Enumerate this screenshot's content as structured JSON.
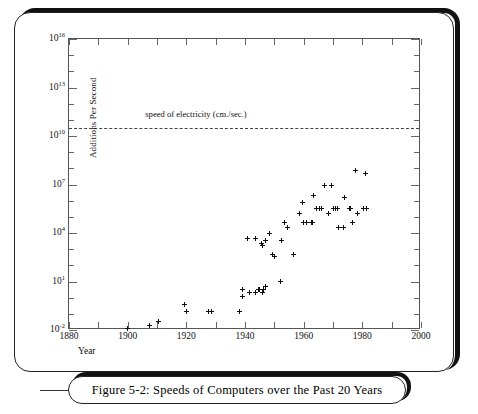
{
  "figure": {
    "caption": "Figure 5-2:   Speeds of Computers over the Past 20 Years"
  },
  "chart_data": {
    "type": "scatter",
    "title": "",
    "xlabel": "Year",
    "ylabel": "Additions Per Second",
    "xlim": [
      1880,
      2000
    ],
    "ylim": [
      0.01,
      1e+16
    ],
    "yscale": "log",
    "xscale": "linear",
    "grid": false,
    "legend": null,
    "xticks": [
      "1880",
      "1900",
      "1920",
      "1940",
      "1960",
      "1980",
      "2000"
    ],
    "xtick_values": [
      1880,
      1900,
      1920,
      1940,
      1960,
      1980,
      2000
    ],
    "yticks": [
      "10^16",
      "10^13",
      "10^10",
      "10^7",
      "10^4",
      "10^1",
      "10^-2"
    ],
    "ytick_exponents": [
      16,
      13,
      10,
      7,
      4,
      1,
      -2
    ],
    "ytick_mantissa": "10",
    "annotations": [
      {
        "name": "speed-of-electricity",
        "text": "speed of electricity (cm./sec.)",
        "kind": "hline-with-label",
        "y_value": 30000000000.0,
        "linestyle": "dashed",
        "label_x_value": 1906,
        "label_y_value": 200000000000.0
      }
    ],
    "marker": "plus",
    "points": [
      {
        "x": 1900.0,
        "y": 0.013
      },
      {
        "x": 1907.5,
        "y": 0.02
      },
      {
        "x": 1910.5,
        "y": 0.033
      },
      {
        "x": 1919.5,
        "y": 0.36
      },
      {
        "x": 1920.0,
        "y": 0.13
      },
      {
        "x": 1927.5,
        "y": 0.13
      },
      {
        "x": 1928.5,
        "y": 0.13
      },
      {
        "x": 1938.0,
        "y": 0.13
      },
      {
        "x": 1939.0,
        "y": 3.3
      },
      {
        "x": 1939.0,
        "y": 1.1
      },
      {
        "x": 1941.5,
        "y": 2.2
      },
      {
        "x": 1943.5,
        "y": 2.0
      },
      {
        "x": 1944.5,
        "y": 3.2
      },
      {
        "x": 1945.0,
        "y": 3.2
      },
      {
        "x": 1945.8,
        "y": 2.0
      },
      {
        "x": 1946.3,
        "y": 3.3
      },
      {
        "x": 1947.0,
        "y": 4.6
      },
      {
        "x": 1952.0,
        "y": 10.0
      },
      {
        "x": 1941.0,
        "y": 4600.0
      },
      {
        "x": 1943.5,
        "y": 4600.0
      },
      {
        "x": 1945.5,
        "y": 2200.0
      },
      {
        "x": 1946.0,
        "y": 1600.0
      },
      {
        "x": 1947.0,
        "y": 3300.0
      },
      {
        "x": 1948.5,
        "y": 10000.0
      },
      {
        "x": 1949.5,
        "y": 460.0
      },
      {
        "x": 1950.0,
        "y": 330.0
      },
      {
        "x": 1952.5,
        "y": 3300.0
      },
      {
        "x": 1956.5,
        "y": 460.0
      },
      {
        "x": 1953.5,
        "y": 46000.0
      },
      {
        "x": 1954.5,
        "y": 22000.0
      },
      {
        "x": 1958.5,
        "y": 150000.0
      },
      {
        "x": 1959.5,
        "y": 800000.0
      },
      {
        "x": 1960.0,
        "y": 46000.0
      },
      {
        "x": 1961.0,
        "y": 46000.0
      },
      {
        "x": 1962.5,
        "y": 46000.0
      },
      {
        "x": 1963.0,
        "y": 46000.0
      },
      {
        "x": 1963.5,
        "y": 2200000.0
      },
      {
        "x": 1964.5,
        "y": 330000.0
      },
      {
        "x": 1965.5,
        "y": 330000.0
      },
      {
        "x": 1966.0,
        "y": 330000.0
      },
      {
        "x": 1967.0,
        "y": 9000000.0
      },
      {
        "x": 1968.5,
        "y": 160000.0
      },
      {
        "x": 1969.5,
        "y": 9000000.0
      },
      {
        "x": 1970.0,
        "y": 330000.0
      },
      {
        "x": 1970.8,
        "y": 330000.0
      },
      {
        "x": 1971.5,
        "y": 330000.0
      },
      {
        "x": 1972.0,
        "y": 22000.0
      },
      {
        "x": 1973.5,
        "y": 22000.0
      },
      {
        "x": 1974.0,
        "y": 1500000.0
      },
      {
        "x": 1975.5,
        "y": 330000.0
      },
      {
        "x": 1976.0,
        "y": 330000.0
      },
      {
        "x": 1976.5,
        "y": 46000.0
      },
      {
        "x": 1977.5,
        "y": 70000000.0
      },
      {
        "x": 1978.5,
        "y": 150000.0
      },
      {
        "x": 1980.5,
        "y": 330000.0
      },
      {
        "x": 1981.0,
        "y": 50000000.0
      },
      {
        "x": 1981.5,
        "y": 330000.0
      }
    ]
  }
}
